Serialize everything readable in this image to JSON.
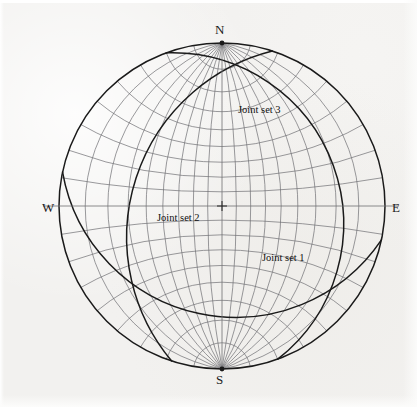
{
  "figure": {
    "type": "stereonet",
    "projection": "equal-angle (Wulff) lower hemisphere",
    "background_color": "#f2f1ef",
    "grid_color": "#6f6f72",
    "great_circle_color": "#1a1a1a",
    "primitive_circle_color": "#1a1a1a"
  },
  "axes": {
    "north_label": "N",
    "south_label": "S",
    "east_label": "E",
    "west_label": "W"
  },
  "center_marker": {
    "symbol": "+",
    "label": "center-cross"
  },
  "annotations": [
    {
      "id": "joint-set-3",
      "label": "Joint set 3",
      "x": 238,
      "y": 104
    },
    {
      "id": "joint-set-2",
      "label": "Joint set 2",
      "x": 157,
      "y": 212
    },
    {
      "id": "joint-set-1",
      "label": "Joint set 1",
      "x": 262,
      "y": 252
    }
  ],
  "chart_data": {
    "type": "scatter",
    "title": "",
    "xlabel": "",
    "ylabel": "",
    "plot_kind": "stereographic projection (Wulff net) with joint-set great circles",
    "net": {
      "center_x": 222,
      "center_y": 206,
      "radius": 163,
      "grid_interval_degrees": 10,
      "great_circle_count": 17,
      "small_circle_count": 17,
      "grid": true
    },
    "cardinal_points": [
      {
        "label": "N",
        "azimuth_deg": 0
      },
      {
        "label": "E",
        "azimuth_deg": 90
      },
      {
        "label": "S",
        "azimuth_deg": 180
      },
      {
        "label": "W",
        "azimuth_deg": 270
      }
    ],
    "series": [
      {
        "name": "Joint set 1",
        "kind": "great-circle",
        "strike_deg": 18,
        "dip_deg": 58,
        "dip_direction_deg": 108
      },
      {
        "name": "Joint set 2",
        "kind": "great-circle",
        "strike_deg": 160,
        "dip_deg": 72,
        "dip_direction_deg": 250
      },
      {
        "name": "Joint set 3",
        "kind": "great-circle",
        "strike_deg": 282,
        "dip_deg": 68,
        "dip_direction_deg": 12
      }
    ],
    "legend_position": "inline-annotations"
  }
}
